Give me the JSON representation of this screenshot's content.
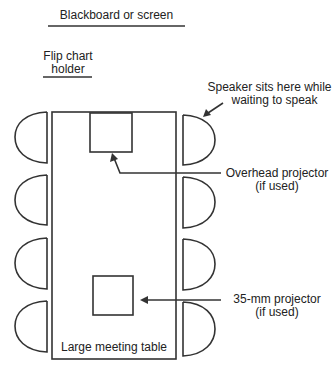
{
  "diagram": {
    "colors": {
      "stroke": "#333333",
      "text": "#222222",
      "background": "#ffffff"
    },
    "labels": {
      "blackboard": "Blackboard or screen",
      "flipchart_line1": "Flip chart",
      "flipchart_line2": "holder",
      "speaker_line1": "Speaker sits here while",
      "speaker_line2": "waiting to speak",
      "overhead_line1": "Overhead projector",
      "overhead_line2": "(if used)",
      "slide_line1": "35-mm projector",
      "slide_line2": "(if used)",
      "table": "Large meeting table"
    },
    "chairs": {
      "left_count": 4,
      "right_count": 4
    }
  }
}
